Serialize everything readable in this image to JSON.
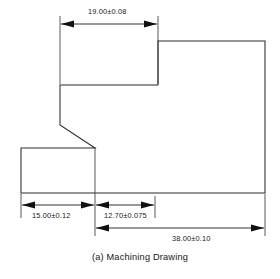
{
  "figure": {
    "caption": "(a) Machining Drawing",
    "units_note": "",
    "line_color": "#2b2b2b",
    "text_color": "#1a1a1a",
    "background": "#ffffff"
  },
  "dimensions": [
    {
      "id": "top-width",
      "label": "19.00±0.08",
      "nominal": "19.00",
      "tolerance": "±0.08",
      "orientation": "horizontal",
      "position": "top"
    },
    {
      "id": "bottom-left-width",
      "label": "15.00±0.12",
      "nominal": "15.00",
      "tolerance": "±0.12",
      "orientation": "horizontal",
      "position": "bottom-left"
    },
    {
      "id": "bottom-middle-width",
      "label": "12.70±0.075",
      "nominal": "12.70",
      "tolerance": "±0.075",
      "orientation": "horizontal",
      "position": "bottom-middle"
    },
    {
      "id": "bottom-overall-width",
      "label": "38.00±0.10",
      "nominal": "38.00",
      "tolerance": "±0.10",
      "orientation": "horizontal",
      "position": "bottom-right"
    }
  ],
  "geometry": {
    "description": "stepped-block-with-chamfer",
    "outline_path": "M 158 41 L 265 41 L 265 193 L 21 193 L 21 148 L 95 148 L 60 125 L 60 85 L 158 85 Z"
  }
}
